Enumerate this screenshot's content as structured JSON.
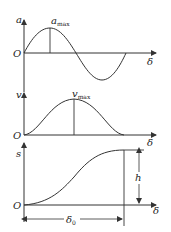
{
  "diagram": {
    "panels": [
      {
        "id": "acceleration",
        "y_label": "a",
        "x_label": "δ",
        "origin_label": "O",
        "peak_label_main": "a",
        "peak_label_sub": "max",
        "curve": "sine"
      },
      {
        "id": "velocity",
        "y_label": "v",
        "x_label": "δ",
        "origin_label": "O",
        "peak_label_main": "v",
        "peak_label_sub": "max",
        "curve": "bell"
      },
      {
        "id": "displacement",
        "y_label": "s",
        "x_label": "δ",
        "origin_label": "O",
        "height_label": "h",
        "span_label_main": "δ",
        "span_label_sub": "0",
        "curve": "s-curve"
      }
    ],
    "colors": {
      "line": "#333333",
      "background": "#ffffff"
    }
  }
}
